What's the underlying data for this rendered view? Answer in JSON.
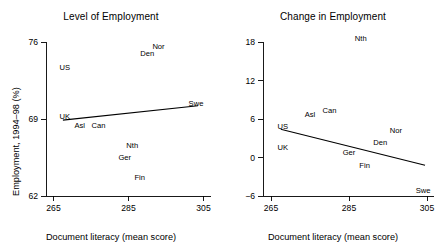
{
  "figure": {
    "background": "#ffffff",
    "ink_color": "#000000",
    "panel_count": 2
  },
  "panels": [
    {
      "id": "level-of-employment",
      "title": "Level of Employment",
      "xlabel": "Document literacy (mean score)",
      "ylabel": "Employment, 1994–98 (%)",
      "xticks": [
        "265",
        "285",
        "305"
      ],
      "yticks": [
        "76",
        "69",
        "62"
      ]
    },
    {
      "id": "change-in-employment",
      "title": "Change in Employment",
      "xlabel": "Document literacy (mean score)",
      "ylabel": "Change in employment, 2000–06 minus 1979 (%)",
      "xticks": [
        "265",
        "285",
        "305"
      ],
      "yticks": [
        "18",
        "12",
        "6",
        "0",
        "−6"
      ]
    }
  ],
  "chart_data": [
    {
      "type": "scatter",
      "id": "level-of-employment",
      "title": "Level of Employment",
      "xlabel": "Document literacy (mean score)",
      "ylabel": "Employment, 1994–98 (%)",
      "xlim": [
        263,
        307
      ],
      "ylim": [
        61.2,
        76.6
      ],
      "xticks": [
        265,
        285,
        305
      ],
      "yticks": [
        76,
        69,
        62
      ],
      "grid": false,
      "legend": false,
      "point_marker": "text-label-only",
      "labels": [
        "US",
        "UK",
        "Asl",
        "Can",
        "Nth",
        "Ger",
        "Fin",
        "Den",
        "Nor",
        "Swe"
      ],
      "x": [
        268,
        268,
        272,
        277,
        286,
        284,
        288,
        290,
        293,
        303
      ],
      "y": [
        73.5,
        69.0,
        68.2,
        68.2,
        66.4,
        65.3,
        63.5,
        74.7,
        75.4,
        70.2
      ],
      "fit_line": {
        "name": "regression line",
        "x": [
          267.5,
          303.5
        ],
        "y": [
          68.9,
          70.2
        ],
        "slope_sign": "positive"
      }
    },
    {
      "type": "scatter",
      "id": "change-in-employment",
      "title": "Change in Employment",
      "xlabel": "Document literacy (mean score)",
      "ylabel": "Change in employment, 2000–06 minus 1979 (%)",
      "xlim": [
        263,
        307
      ],
      "ylim": [
        -7.2,
        19.5
      ],
      "xticks": [
        265,
        285,
        305
      ],
      "yticks": [
        18,
        12,
        6,
        0,
        -6
      ],
      "grid": false,
      "legend": false,
      "point_marker": "text-label-only",
      "labels": [
        "US",
        "UK",
        "Asl",
        "Can",
        "Nth",
        "Ger",
        "Fin",
        "Den",
        "Nor",
        "Swe"
      ],
      "x": [
        268,
        268,
        275,
        280,
        288,
        285,
        289,
        293,
        297,
        304
      ],
      "y": [
        4.5,
        1.2,
        6.3,
        7.0,
        18.2,
        0.4,
        -1.6,
        1.9,
        3.8,
        -5.5
      ],
      "fit_line": {
        "name": "regression line",
        "x": [
          267.5,
          304.5
        ],
        "y": [
          4.4,
          -1.2
        ],
        "slope_sign": "negative"
      }
    }
  ]
}
